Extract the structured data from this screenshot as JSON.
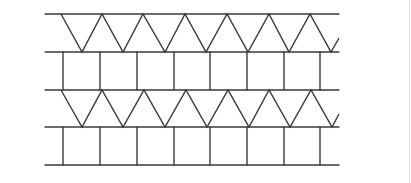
{
  "figure": {
    "stroke_color": "#3a3a3a",
    "stroke_width": 1.4,
    "x_start": 45,
    "x_end": 339,
    "horizontal_lines_y": [
      14,
      52,
      90,
      127,
      165
    ],
    "strips": [
      {
        "type": "zigzag",
        "y_top": 14,
        "y_bottom": 52,
        "points": [
          [
            61,
            14
          ],
          [
            82,
            52
          ],
          [
            102,
            14
          ],
          [
            123,
            52
          ],
          [
            143,
            14
          ],
          [
            165,
            52
          ],
          [
            185,
            14
          ],
          [
            206,
            52
          ],
          [
            227,
            14
          ],
          [
            248,
            52
          ],
          [
            269,
            14
          ],
          [
            289,
            52
          ],
          [
            310,
            14
          ],
          [
            331,
            52
          ],
          [
            339,
            38
          ]
        ]
      },
      {
        "type": "rectangles",
        "y_top": 52,
        "y_bottom": 90,
        "verticals_x": [
          63,
          100,
          137,
          174,
          210,
          247,
          284,
          320
        ]
      },
      {
        "type": "zigzag",
        "y_top": 90,
        "y_bottom": 127,
        "points": [
          [
            61,
            90
          ],
          [
            82,
            127
          ],
          [
            102,
            90
          ],
          [
            123,
            127
          ],
          [
            144,
            90
          ],
          [
            165,
            127
          ],
          [
            186,
            90
          ],
          [
            207,
            127
          ],
          [
            228,
            90
          ],
          [
            249,
            127
          ],
          [
            269,
            90
          ],
          [
            290,
            127
          ],
          [
            311,
            90
          ],
          [
            332,
            127
          ],
          [
            339,
            114
          ]
        ]
      },
      {
        "type": "rectangles",
        "y_top": 127,
        "y_bottom": 165,
        "verticals_x": [
          63,
          100,
          137,
          174,
          210,
          247,
          284,
          320
        ]
      }
    ],
    "frame_border_color": "#e4e4e4"
  }
}
